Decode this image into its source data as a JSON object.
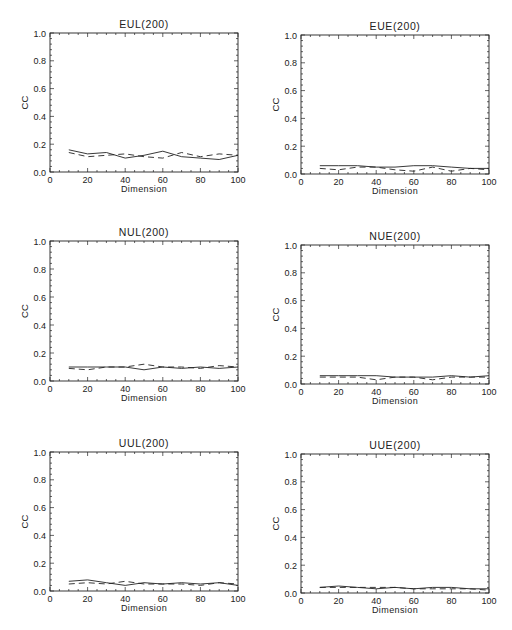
{
  "figure": {
    "background": "#ffffff",
    "line_color": "#222222"
  },
  "chart_data": [
    {
      "type": "line",
      "title": "EUL(200)",
      "xlabel": "Dimension",
      "ylabel": "CC",
      "xlim": [
        0,
        100
      ],
      "ylim": [
        0.0,
        1.0
      ],
      "xticks": [
        0,
        20,
        40,
        60,
        80,
        100
      ],
      "yticks": [
        "0.0",
        "0.2",
        "0.4",
        "0.6",
        "0.8",
        "1.0"
      ],
      "grid": false,
      "legend": null,
      "x": [
        10,
        20,
        30,
        40,
        50,
        60,
        70,
        80,
        90,
        100
      ],
      "series": [
        {
          "name": "solid",
          "style": "solid",
          "values": [
            0.16,
            0.13,
            0.14,
            0.1,
            0.12,
            0.15,
            0.11,
            0.1,
            0.09,
            0.12
          ]
        },
        {
          "name": "dashed",
          "style": "dashed",
          "values": [
            0.14,
            0.11,
            0.12,
            0.13,
            0.11,
            0.1,
            0.14,
            0.11,
            0.13,
            0.12
          ]
        }
      ],
      "frame": {
        "x0": 50,
        "y0": 33,
        "x1": 238,
        "y1": 172
      }
    },
    {
      "type": "line",
      "title": "EUE(200)",
      "xlabel": "Dimension",
      "ylabel": "CC",
      "xlim": [
        0,
        100
      ],
      "ylim": [
        0.0,
        1.0
      ],
      "xticks": [
        0,
        20,
        40,
        60,
        80,
        100
      ],
      "yticks": [
        "0.0",
        "0.2",
        "0.4",
        "0.6",
        "0.8",
        "1.0"
      ],
      "grid": false,
      "legend": null,
      "x": [
        10,
        20,
        30,
        40,
        50,
        60,
        70,
        80,
        90,
        100
      ],
      "series": [
        {
          "name": "solid",
          "style": "solid",
          "values": [
            0.06,
            0.06,
            0.06,
            0.05,
            0.05,
            0.06,
            0.06,
            0.05,
            0.04,
            0.04
          ]
        },
        {
          "name": "dashed",
          "style": "dashed",
          "values": [
            0.04,
            0.03,
            0.05,
            0.05,
            0.03,
            0.02,
            0.05,
            0.02,
            0.04,
            0.03
          ]
        }
      ],
      "frame": {
        "x0": 301,
        "y0": 35,
        "x1": 489,
        "y1": 174
      }
    },
    {
      "type": "line",
      "title": "NUL(200)",
      "xlabel": "Dimension",
      "ylabel": "CC",
      "xlim": [
        0,
        100
      ],
      "ylim": [
        0.0,
        1.0
      ],
      "xticks": [
        0,
        20,
        40,
        60,
        80,
        100
      ],
      "yticks": [
        "0.0",
        "0.2",
        "0.4",
        "0.6",
        "0.8",
        "1.0"
      ],
      "grid": false,
      "legend": null,
      "x": [
        10,
        20,
        30,
        40,
        50,
        60,
        70,
        80,
        90,
        100
      ],
      "series": [
        {
          "name": "solid",
          "style": "solid",
          "values": [
            0.1,
            0.1,
            0.1,
            0.1,
            0.08,
            0.1,
            0.09,
            0.1,
            0.09,
            0.1
          ]
        },
        {
          "name": "dashed",
          "style": "dashed",
          "values": [
            0.09,
            0.08,
            0.1,
            0.1,
            0.12,
            0.1,
            0.1,
            0.09,
            0.11,
            0.1
          ]
        }
      ],
      "frame": {
        "x0": 50,
        "y0": 241,
        "x1": 238,
        "y1": 381
      }
    },
    {
      "type": "line",
      "title": "NUE(200)",
      "xlabel": "Dimension",
      "ylabel": "CC",
      "xlim": [
        0,
        100
      ],
      "ylim": [
        0.0,
        1.0
      ],
      "xticks": [
        0,
        20,
        40,
        60,
        80,
        100
      ],
      "yticks": [
        "0.0",
        "0.2",
        "0.4",
        "0.6",
        "0.8",
        "1.0"
      ],
      "grid": false,
      "legend": null,
      "x": [
        10,
        20,
        30,
        40,
        50,
        60,
        70,
        80,
        90,
        100
      ],
      "series": [
        {
          "name": "solid",
          "style": "solid",
          "values": [
            0.06,
            0.06,
            0.06,
            0.06,
            0.05,
            0.05,
            0.05,
            0.06,
            0.05,
            0.06
          ]
        },
        {
          "name": "dashed",
          "style": "dashed",
          "values": [
            0.05,
            0.05,
            0.05,
            0.03,
            0.05,
            0.05,
            0.03,
            0.05,
            0.05,
            0.05
          ]
        }
      ],
      "frame": {
        "x0": 301,
        "y0": 245,
        "x1": 489,
        "y1": 384
      }
    },
    {
      "type": "line",
      "title": "UUL(200)",
      "xlabel": "Dimension",
      "ylabel": "CC",
      "xlim": [
        0,
        100
      ],
      "ylim": [
        0.0,
        1.0
      ],
      "xticks": [
        0,
        20,
        40,
        60,
        80,
        100
      ],
      "yticks": [
        "0.0",
        "0.2",
        "0.4",
        "0.6",
        "0.8",
        "1.0"
      ],
      "grid": false,
      "legend": null,
      "x": [
        10,
        20,
        30,
        40,
        50,
        60,
        70,
        80,
        90,
        100
      ],
      "series": [
        {
          "name": "solid",
          "style": "solid",
          "values": [
            0.07,
            0.08,
            0.06,
            0.04,
            0.06,
            0.05,
            0.06,
            0.05,
            0.06,
            0.04
          ]
        },
        {
          "name": "dashed",
          "style": "dashed",
          "values": [
            0.05,
            0.06,
            0.05,
            0.07,
            0.05,
            0.05,
            0.05,
            0.04,
            0.06,
            0.05
          ]
        }
      ],
      "frame": {
        "x0": 50,
        "y0": 452,
        "x1": 238,
        "y1": 591
      }
    },
    {
      "type": "line",
      "title": "UUE(200)",
      "xlabel": "Dimension",
      "ylabel": "CC",
      "xlim": [
        0,
        100
      ],
      "ylim": [
        0.0,
        1.0
      ],
      "xticks": [
        0,
        20,
        40,
        60,
        80,
        100
      ],
      "yticks": [
        "0.0",
        "0.2",
        "0.4",
        "0.6",
        "0.8",
        "1.0"
      ],
      "grid": false,
      "legend": null,
      "x": [
        10,
        20,
        30,
        40,
        50,
        60,
        70,
        80,
        90,
        100
      ],
      "series": [
        {
          "name": "solid",
          "style": "solid",
          "values": [
            0.04,
            0.05,
            0.04,
            0.03,
            0.04,
            0.03,
            0.04,
            0.04,
            0.03,
            0.03
          ]
        },
        {
          "name": "dashed",
          "style": "dashed",
          "values": [
            0.04,
            0.04,
            0.04,
            0.04,
            0.04,
            0.03,
            0.03,
            0.03,
            0.03,
            0.02
          ]
        }
      ],
      "frame": {
        "x0": 301,
        "y0": 454,
        "x1": 489,
        "y1": 593
      }
    }
  ]
}
